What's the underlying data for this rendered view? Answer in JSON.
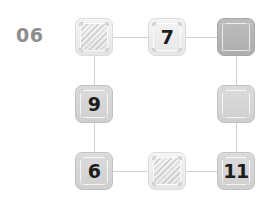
{
  "panel": {
    "label": "06",
    "label_color": "#8d8d8d",
    "background": "#ffffff"
  },
  "board": {
    "columns": 3,
    "rows": 3,
    "connector_color": "#cfcfcf",
    "tiles": [
      {
        "id": "r1c1",
        "row": 1,
        "col": 1,
        "label": "",
        "style": "light",
        "hatched": true,
        "x": 75,
        "y": 18
      },
      {
        "id": "r1c2",
        "row": 1,
        "col": 2,
        "label": "7",
        "style": "light",
        "hatched": false,
        "x": 148,
        "y": 18
      },
      {
        "id": "r1c3",
        "row": 1,
        "col": 3,
        "label": "",
        "style": "dark",
        "hatched": false,
        "x": 217,
        "y": 18
      },
      {
        "id": "r2c1",
        "row": 2,
        "col": 1,
        "label": "9",
        "style": "mid",
        "hatched": false,
        "x": 75,
        "y": 85
      },
      {
        "id": "r2c3",
        "row": 2,
        "col": 3,
        "label": "",
        "style": "mid",
        "hatched": false,
        "x": 217,
        "y": 85
      },
      {
        "id": "r3c1",
        "row": 3,
        "col": 1,
        "label": "6",
        "style": "mid",
        "hatched": false,
        "x": 75,
        "y": 152
      },
      {
        "id": "r3c2",
        "row": 3,
        "col": 2,
        "label": "",
        "style": "light",
        "hatched": true,
        "x": 148,
        "y": 152
      },
      {
        "id": "r3c3",
        "row": 3,
        "col": 3,
        "label": "11",
        "style": "mid",
        "hatched": false,
        "x": 217,
        "y": 152
      }
    ],
    "connectors": [
      {
        "id": "c-r1c1-r1c2",
        "orientation": "h",
        "x": 113,
        "y": 37,
        "length": 35
      },
      {
        "id": "c-r1c2-r1c3",
        "orientation": "h",
        "x": 186,
        "y": 37,
        "length": 31
      },
      {
        "id": "c-r3c1-r3c2",
        "orientation": "h",
        "x": 113,
        "y": 171,
        "length": 35
      },
      {
        "id": "c-r3c2-r3c3",
        "orientation": "h",
        "x": 186,
        "y": 171,
        "length": 31
      },
      {
        "id": "c-r1c1-r2c1",
        "orientation": "v",
        "x": 94,
        "y": 56,
        "length": 29
      },
      {
        "id": "c-r2c1-r3c1",
        "orientation": "v",
        "x": 94,
        "y": 123,
        "length": 29
      },
      {
        "id": "c-r1c3-r2c3",
        "orientation": "v",
        "x": 236,
        "y": 56,
        "length": 29
      },
      {
        "id": "c-r2c3-r3c3",
        "orientation": "v",
        "x": 236,
        "y": 123,
        "length": 29
      }
    ]
  }
}
